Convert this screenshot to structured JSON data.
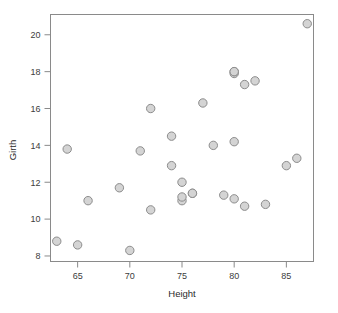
{
  "chart_data": {
    "type": "scatter",
    "title": "",
    "xlabel": "Height",
    "ylabel": "Girth",
    "xlim": [
      62.4,
      87.6
    ],
    "ylim": [
      7.7,
      21.1
    ],
    "xticks": [
      65,
      70,
      75,
      80,
      85
    ],
    "yticks": [
      8,
      10,
      12,
      14,
      16,
      18,
      20
    ],
    "xtick_labels": [
      "65",
      "70",
      "75",
      "80",
      "85"
    ],
    "ytick_labels": [
      "8",
      "10",
      "12",
      "14",
      "16",
      "18",
      "20"
    ],
    "grid": false,
    "legend": false,
    "marker": {
      "shape": "circle",
      "fill_color": "#d4d4d4",
      "edge_color": "#8c8c8c",
      "radius": 4.2
    },
    "frame_color": "#8a8a8a",
    "n_points": 31,
    "x": [
      70,
      65,
      63,
      72,
      81,
      83,
      66,
      75,
      80,
      75,
      79,
      76,
      76,
      69,
      75,
      74,
      85,
      86,
      71,
      64,
      78,
      80,
      74,
      72,
      77,
      81,
      82,
      80,
      80,
      80,
      87
    ],
    "y": [
      8.3,
      8.6,
      8.8,
      10.5,
      10.7,
      10.8,
      11.0,
      11.0,
      11.1,
      11.2,
      11.3,
      11.4,
      11.4,
      11.7,
      12.0,
      12.9,
      12.9,
      13.3,
      13.7,
      13.8,
      14.0,
      14.2,
      14.5,
      16.0,
      16.3,
      17.3,
      17.5,
      17.9,
      18.0,
      18.0,
      20.6
    ],
    "points": [
      {
        "x": 70,
        "y": 8.3
      },
      {
        "x": 65,
        "y": 8.6
      },
      {
        "x": 63,
        "y": 8.8
      },
      {
        "x": 72,
        "y": 10.5
      },
      {
        "x": 81,
        "y": 10.7
      },
      {
        "x": 83,
        "y": 10.8
      },
      {
        "x": 66,
        "y": 11.0
      },
      {
        "x": 75,
        "y": 11.0
      },
      {
        "x": 80,
        "y": 11.1
      },
      {
        "x": 75,
        "y": 11.2
      },
      {
        "x": 79,
        "y": 11.3
      },
      {
        "x": 76,
        "y": 11.4
      },
      {
        "x": 76,
        "y": 11.4
      },
      {
        "x": 69,
        "y": 11.7
      },
      {
        "x": 75,
        "y": 12.0
      },
      {
        "x": 74,
        "y": 12.9
      },
      {
        "x": 85,
        "y": 12.9
      },
      {
        "x": 86,
        "y": 13.3
      },
      {
        "x": 71,
        "y": 13.7
      },
      {
        "x": 64,
        "y": 13.8
      },
      {
        "x": 78,
        "y": 14.0
      },
      {
        "x": 80,
        "y": 14.2
      },
      {
        "x": 74,
        "y": 14.5
      },
      {
        "x": 72,
        "y": 16.0
      },
      {
        "x": 77,
        "y": 16.3
      },
      {
        "x": 81,
        "y": 17.3
      },
      {
        "x": 82,
        "y": 17.5
      },
      {
        "x": 80,
        "y": 17.9
      },
      {
        "x": 80,
        "y": 18.0
      },
      {
        "x": 80,
        "y": 18.0
      },
      {
        "x": 87,
        "y": 20.6
      }
    ]
  }
}
